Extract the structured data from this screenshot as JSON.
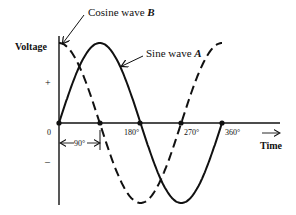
{
  "diagram": {
    "type": "phase-diagram",
    "y_axis_label": "Voltage",
    "x_axis_label": "Time",
    "plus_sign": "+",
    "minus_sign": "–",
    "origin_label": "0",
    "ticks": [
      "180°",
      "270°",
      "360°"
    ],
    "phase_shift_label": "90°",
    "time_arrow": "⟶",
    "colors": {
      "line": "#111111",
      "background": "#ffffff"
    },
    "series": [
      {
        "name": "Sine wave",
        "letter": "A",
        "style": "solid",
        "phase_deg": 0,
        "x_deg": [
          0,
          90,
          180,
          270,
          360
        ],
        "y": [
          0,
          1,
          0,
          -1,
          0
        ]
      },
      {
        "name": "Cosine wave",
        "letter": "B",
        "style": "dashed",
        "phase_deg": 90,
        "x_deg": [
          0,
          90,
          180,
          270,
          360
        ],
        "y": [
          1,
          0,
          -1,
          0,
          1
        ]
      }
    ],
    "callouts": {
      "cosine": {
        "text": "Cosine wave",
        "letter": "B"
      },
      "sine": {
        "text": "Sine wave",
        "letter": "A"
      }
    }
  }
}
